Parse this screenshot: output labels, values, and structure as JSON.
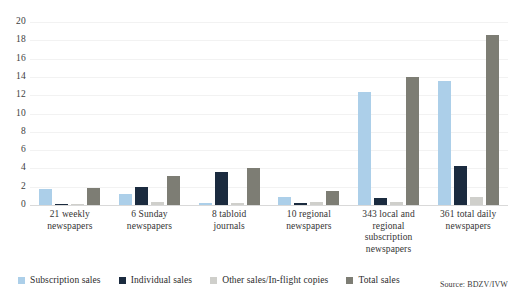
{
  "chart_data": {
    "type": "bar",
    "title": "",
    "subtitle": "",
    "xlabel": "",
    "ylabel": "",
    "ylim": [
      0,
      20
    ],
    "yticks": [
      0,
      2,
      4,
      6,
      8,
      10,
      12,
      14,
      16,
      18,
      20
    ],
    "grid": true,
    "legend_position": "bottom",
    "categories": [
      "21 weekly newspapers",
      "6 Sunday newspapers",
      "8 tabloid journals",
      "10 regional newspapers",
      "343 local and regional subscription newspapers",
      "361 total daily newspapers"
    ],
    "series": [
      {
        "name": "Subscription sales",
        "color": "#ACCFE9",
        "values": [
          1.7,
          1.2,
          0.2,
          0.9,
          12.4,
          13.5
        ]
      },
      {
        "name": "Individual sales",
        "color": "#1B2B3F",
        "values": [
          0.1,
          2.0,
          3.6,
          0.2,
          0.8,
          4.3
        ]
      },
      {
        "name": "Other sales/In-flight copies",
        "color": "#CFCFCB",
        "values": [
          0.1,
          0.3,
          0.2,
          0.3,
          0.3,
          0.9
        ]
      },
      {
        "name": "Total sales",
        "color": "#7D7D74",
        "values": [
          1.9,
          3.2,
          4.0,
          1.5,
          14.0,
          18.6
        ]
      }
    ],
    "annotations": [
      "Source: BDZV/IVW"
    ]
  },
  "axis": {
    "ticks": [
      "20",
      "18",
      "16",
      "14",
      "12",
      "10",
      "8",
      "6",
      "4",
      "2",
      "0"
    ]
  },
  "xlabels": [
    {
      "line1": "21 weekly",
      "line2": "newspapers",
      "line3": "",
      "line4": ""
    },
    {
      "line1": "6 Sunday",
      "line2": "newspapers",
      "line3": "",
      "line4": ""
    },
    {
      "line1": "8 tabloid",
      "line2": "journals",
      "line3": "",
      "line4": ""
    },
    {
      "line1": "10 regional",
      "line2": "newspapers",
      "line3": "",
      "line4": ""
    },
    {
      "line1": "343 local and",
      "line2": "regional",
      "line3": "subscription",
      "line4": "newspapers"
    },
    {
      "line1": "361 total daily",
      "line2": "newspapers",
      "line3": "",
      "line4": ""
    }
  ],
  "legend": [
    {
      "label": "Subscription sales"
    },
    {
      "label": "Individual sales"
    },
    {
      "label": "Other sales/In-flight copies"
    },
    {
      "label": "Total sales"
    }
  ],
  "source": {
    "text": "Source: BDZV/IVW"
  }
}
